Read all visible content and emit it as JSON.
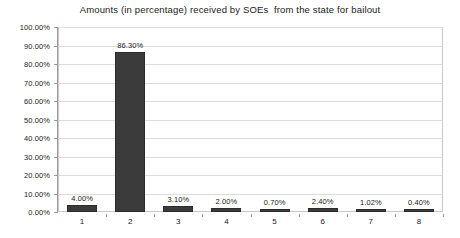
{
  "chart_data": {
    "type": "bar",
    "title": "Amounts (in percentage) received by SOEs  from the state for bailout",
    "xlabel": "",
    "ylabel": "",
    "categories": [
      "1",
      "2",
      "3",
      "4",
      "5",
      "6",
      "7",
      "8"
    ],
    "values": [
      4.0,
      86.3,
      3.1,
      2.0,
      0.7,
      2.4,
      1.02,
      0.4
    ],
    "data_labels": [
      "4.00%",
      "86.30%",
      "3.10%",
      "2.00%",
      "0.70%",
      "2.40%",
      "1.02%",
      "0.40%"
    ],
    "ylim": [
      0,
      100
    ],
    "ytick_values": [
      0,
      10,
      20,
      30,
      40,
      50,
      60,
      70,
      80,
      90,
      100
    ],
    "ytick_labels": [
      "0.00%",
      "10.00%",
      "20.00%",
      "30.00%",
      "40.00%",
      "50.00%",
      "60.00%",
      "70.00%",
      "80.00%",
      "90.00%",
      "100.00%"
    ],
    "grid": true,
    "grid_axis": "y",
    "legend": false,
    "legend_position": "none",
    "bar_color": "#3b3b3b",
    "grid_color": "#dcdcdc",
    "axis_color": "#9a9a9a",
    "plot_background": "#ffffff",
    "text_color": "#1a1a1a"
  }
}
